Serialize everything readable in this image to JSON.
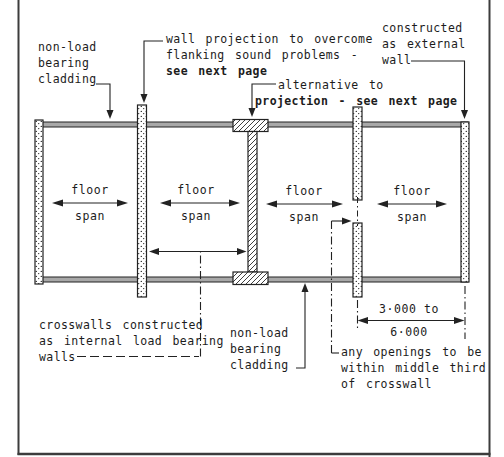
{
  "diagram": {
    "colors": {
      "ink": "#1c1c1c",
      "cladding_fill": "#a8a8a8",
      "background": "#ffffff"
    },
    "labels": {
      "cladding_top": {
        "l1": "non-load",
        "l2": "bearing",
        "l3": "cladding"
      },
      "wall_projection": {
        "l1": "wall projection to overcome",
        "l2": "flanking sound problems -",
        "l3": "see next page"
      },
      "alternative": {
        "l1": "alternative to",
        "l2": "projection - see next page"
      },
      "external_wall": {
        "l1": "constructed",
        "l2": "as external",
        "l3": "wall"
      },
      "crosswalls": {
        "l1": "crosswalls constructed",
        "l2": "as internal load bearing",
        "l3": "walls"
      },
      "cladding_bottom": {
        "l1": "non-load",
        "l2": "bearing",
        "l3": "cladding"
      },
      "openings": {
        "l1": "any openings to be",
        "l2": "within middle third",
        "l3": "of crosswall"
      }
    },
    "floor_spans": [
      {
        "l1": "floor",
        "l2": "span"
      },
      {
        "l1": "floor",
        "l2": "span"
      },
      {
        "l1": "floor",
        "l2": "span"
      },
      {
        "l1": "floor",
        "l2": "span"
      }
    ],
    "dimension": {
      "upper": "3·000 to",
      "lower": "6·000"
    }
  }
}
